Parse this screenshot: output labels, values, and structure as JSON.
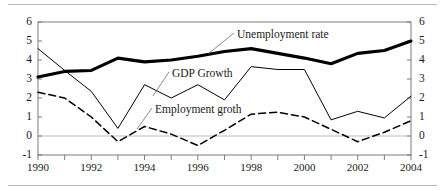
{
  "chart_data": {
    "type": "line",
    "title": "",
    "subtitle": "",
    "xlabel": "",
    "ylabel": "",
    "xlim": [
      1990,
      2004
    ],
    "ylim": [
      -1,
      6
    ],
    "ytick_values": [
      6,
      5,
      4,
      3,
      2,
      1,
      0,
      -1
    ],
    "ytick_labels": [
      "6",
      "5",
      "4",
      "3",
      "2",
      "1",
      "0",
      "-1"
    ],
    "ytick_labels_right": [
      "6",
      "5",
      "4",
      "3",
      "2",
      "1",
      "0",
      "-1"
    ],
    "dual_axis": true,
    "grid": false,
    "zero_line": true,
    "legend_position": "inline-annotations",
    "x": [
      1990,
      1991,
      1992,
      1993,
      1994,
      1995,
      1996,
      1997,
      1998,
      1999,
      2000,
      2001,
      2002,
      2003,
      2004
    ],
    "xtick_labels": [
      "1990",
      "1992",
      "1994",
      "1996",
      "1998",
      "2000",
      "2002",
      "2004"
    ],
    "xtick_values": [
      1990,
      1992,
      1994,
      1996,
      1998,
      2000,
      2002,
      2004
    ],
    "series": [
      {
        "name": "Unemployment rate",
        "style": "thick-solid",
        "color": "#000000",
        "values": [
          3.1,
          3.4,
          3.45,
          4.1,
          3.9,
          4.0,
          4.2,
          4.45,
          4.6,
          4.35,
          4.1,
          3.8,
          4.35,
          4.5,
          5.0
        ]
      },
      {
        "name": "GDP Growth",
        "style": "thin-solid",
        "color": "#000000",
        "values": [
          4.6,
          3.45,
          2.35,
          0.4,
          2.7,
          2.0,
          2.7,
          1.9,
          3.65,
          3.5,
          3.5,
          0.85,
          1.3,
          0.95,
          2.1
        ]
      },
      {
        "name": "Employment groth",
        "style": "dashed",
        "color": "#000000",
        "values": [
          2.3,
          2.0,
          1.0,
          -0.3,
          0.5,
          0.1,
          -0.5,
          0.3,
          1.15,
          1.25,
          1.0,
          0.35,
          -0.3,
          0.2,
          0.8
        ]
      }
    ],
    "annotations": [
      {
        "text": "Unemployment rate",
        "x_px": 237,
        "y_px": 28,
        "leader_to_x": 208,
        "leader_to_y": 54
      },
      {
        "text": "GDP Growth",
        "x_px": 172,
        "y_px": 67,
        "leader_to_x": 153,
        "leader_to_y": 96
      },
      {
        "text": "Employment groth",
        "x_px": 155,
        "y_px": 103,
        "leader_to_x": 137,
        "leader_to_y": 129
      }
    ]
  },
  "colors": {
    "background": "#ffffff",
    "frame": "#6e6e6e",
    "zero_line": "#bdbdbd",
    "series_line": "#000000",
    "rule": "#b9b9b9",
    "text": "#1a1a1a"
  }
}
